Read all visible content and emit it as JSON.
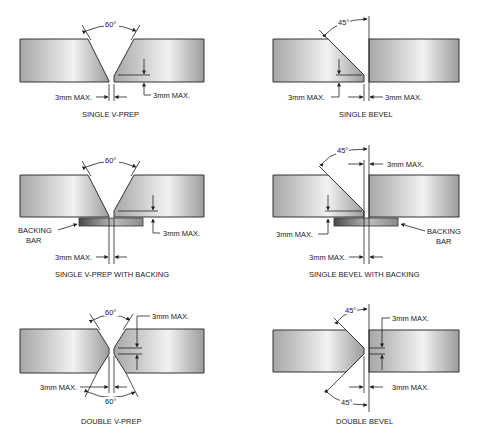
{
  "panels": [
    {
      "id": "single-v-prep",
      "caption": "SINGLE V-PREP",
      "angle": "60°",
      "gap_label": "3mm MAX.",
      "root_face_label": "3mm MAX."
    },
    {
      "id": "single-bevel",
      "caption": "SINGLE BEVEL",
      "angle": "45°",
      "gap_label": "3mm MAX.",
      "root_face_label": "3mm MAX."
    },
    {
      "id": "single-v-prep-with-backing",
      "caption": "SINGLE V-PREP WITH BACKING",
      "angle": "60°",
      "gap_label": "3mm MAX.",
      "root_face_label": "3mm MAX.",
      "backing_label_1": "BACKING",
      "backing_label_2": "BAR"
    },
    {
      "id": "single-bevel-with-backing",
      "caption": "SINGLE BEVEL WITH BACKING",
      "angle": "45°",
      "gap_label": "3mm MAX.",
      "root_face_label": "3mm MAX.",
      "backing_label_1": "BACKING",
      "backing_label_2": "BAR"
    },
    {
      "id": "double-v-prep",
      "caption": "DOUBLE V-PREP",
      "angle_top": "60°",
      "angle_bottom": "60°",
      "gap_label": "3mm MAX.",
      "root_face_label": "3mm MAX."
    },
    {
      "id": "double-bevel",
      "caption": "DOUBLE BEVEL",
      "angle_top": "45°",
      "angle_bottom": "45°",
      "gap_label": "3mm MAX.",
      "root_face_label": "3mm MAX."
    }
  ],
  "colors": {
    "plate_dark": "#9a9a9a",
    "plate_light": "#f4f4f4",
    "backing_dark": "#555555",
    "backing_light": "#dcdcdc",
    "line": "#222222"
  }
}
